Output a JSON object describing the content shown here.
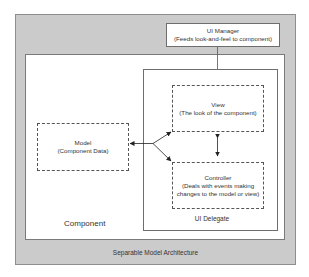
{
  "diagram": {
    "outer": {
      "label": "Separable Model Architecture",
      "fill": "#cbcbcb"
    },
    "component": {
      "label": "Component"
    },
    "ui_manager": {
      "title": "UI Manager",
      "subtitle": "(Feeds look-and-feel to component)"
    },
    "ui_delegate": {
      "label": "UI Delegate"
    },
    "view": {
      "title": "View",
      "subtitle": "(The look of the component)"
    },
    "controller": {
      "title": "Controller",
      "subtitle_line1": "(Deals with events making",
      "subtitle_line2": "changes to the model or view)"
    },
    "model": {
      "title": "Model",
      "subtitle": "(Component Data)"
    },
    "connections": [
      {
        "from": "ui_manager",
        "to": "ui_delegate",
        "style": "line"
      },
      {
        "from": "view",
        "to": "controller",
        "style": "double-arrow"
      },
      {
        "from": "branch",
        "to": "model",
        "style": "arrow"
      },
      {
        "from": "branch",
        "to": "view",
        "style": "arrow"
      },
      {
        "from": "branch",
        "to": "controller",
        "style": "arrow"
      }
    ]
  }
}
